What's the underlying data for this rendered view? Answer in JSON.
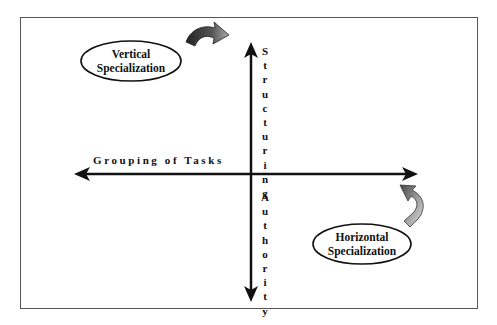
{
  "diagram": {
    "vertical_specialization": "Vertical Specialization",
    "vertical_specialization_lines": [
      "Vertical",
      "Specialization"
    ],
    "horizontal_specialization_lines": [
      "Horizontal",
      "Specialization"
    ],
    "horizontal_axis_label": "Grouping of Tasks",
    "vertical_axis_top_label": "Structuring",
    "vertical_axis_bottom_label": "Authority",
    "vertical_axis_top_letters": [
      "S",
      "t",
      "r",
      "u",
      "c",
      "t",
      "u",
      "r",
      "i",
      "n",
      "g"
    ],
    "vertical_axis_bottom_letters": [
      "A",
      "u",
      "t",
      "h",
      "o",
      "r",
      "i",
      "t",
      "y"
    ],
    "colors": {
      "line": "#111111",
      "frame": "#555555",
      "curved_arrow_dark": "#2a2a2a",
      "curved_arrow_light": "#9a9a9a"
    }
  }
}
